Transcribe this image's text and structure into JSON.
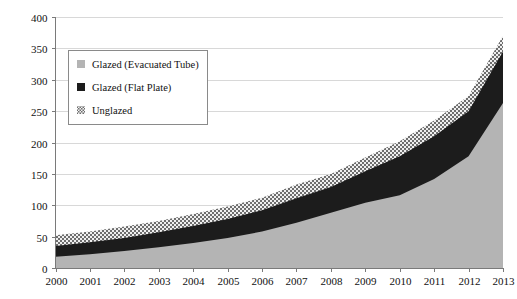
{
  "chart_data": {
    "type": "area",
    "stacked": true,
    "title": "",
    "subtitle": "",
    "xlabel": "",
    "ylabel": "",
    "categories": [
      "2000",
      "2001",
      "2002",
      "2003",
      "2004",
      "2005",
      "2006",
      "2007",
      "2008",
      "2009",
      "2010",
      "2011",
      "2012",
      "2013"
    ],
    "x": [
      2000,
      2001,
      2002,
      2003,
      2004,
      2005,
      2006,
      2007,
      2008,
      2009,
      2010,
      2011,
      2012,
      2013
    ],
    "ylim": [
      0,
      400
    ],
    "xlim": [
      2000,
      2013
    ],
    "yticks": [
      0,
      50,
      100,
      150,
      200,
      250,
      300,
      350,
      400
    ],
    "ytick_labels": [
      "0",
      "50",
      "100",
      "150",
      "200",
      "250",
      "300",
      "350",
      "400"
    ],
    "xticks": [
      2000,
      2001,
      2002,
      2003,
      2004,
      2005,
      2006,
      2007,
      2008,
      2009,
      2010,
      2011,
      2012,
      2013
    ],
    "xtick_labels": [
      "2000",
      "2001",
      "2002",
      "2003",
      "2004",
      "2005",
      "2006",
      "2007",
      "2008",
      "2009",
      "2010",
      "2011",
      "2012",
      "2013"
    ],
    "grid": true,
    "grid_axis": "y",
    "legend_position": "upper-left-inset",
    "stack_order_bottom_to_top": [
      "Glazed (Evacuated Tube)",
      "Glazed (Flat Plate)",
      "Unglazed"
    ],
    "series": [
      {
        "name": "Glazed (Evacuated Tube)",
        "color": "#b4b4b4",
        "pattern": "solid",
        "values": [
          18,
          22,
          27,
          33,
          40,
          48,
          58,
          72,
          88,
          104,
          116,
          142,
          178,
          263
        ]
      },
      {
        "name": "Glazed (Flat Plate)",
        "color": "#1c1c1c",
        "pattern": "solid",
        "values": [
          17,
          19,
          21,
          24,
          27,
          30,
          34,
          39,
          41,
          50,
          62,
          68,
          72,
          82
        ]
      },
      {
        "name": "Unglazed",
        "color": "#9a9a9a",
        "pattern": "checker",
        "values": [
          17,
          17,
          18,
          18,
          19,
          20,
          20,
          22,
          21,
          22,
          24,
          25,
          24,
          25
        ]
      }
    ],
    "cumulative_totals": [
      52,
      58,
      66,
      75,
      86,
      98,
      112,
      133,
      150,
      176,
      202,
      235,
      274,
      370
    ]
  },
  "legend": {
    "entries": [
      {
        "label": "Glazed (Evacuated Tube)",
        "swatch": "evacuated-tube-swatch"
      },
      {
        "label": "Glazed (Flat Plate)",
        "swatch": "flat-plate-swatch"
      },
      {
        "label": "Unglazed",
        "swatch": "unglazed-swatch"
      }
    ]
  },
  "colors": {
    "evacuated_tube": "#b4b4b4",
    "flat_plate": "#1c1c1c",
    "unglazed_light": "#e9e9e9",
    "unglazed_dark": "#6e6e6e",
    "gridline": "#d8d8d8",
    "axis": "#7a7a7a",
    "text": "#111111",
    "background": "#ffffff"
  }
}
